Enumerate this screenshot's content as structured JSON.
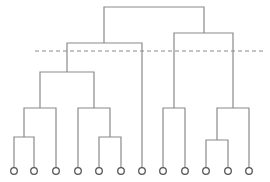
{
  "diagram": {
    "type": "dendrogram",
    "colors": {
      "line": "#8a8a8a",
      "cut": "#8a8a8a",
      "leaf": "#555555"
    },
    "leaf_count": 12,
    "leaves_x": [
      14,
      34,
      56,
      78,
      99,
      121,
      142,
      163,
      185,
      206,
      228,
      249
    ],
    "leaf_y": 171,
    "links": [
      {
        "x1": 14,
        "x2": 34,
        "y": 137,
        "from_y": [
          171,
          171
        ],
        "mid": 24
      },
      {
        "x1": 99,
        "x2": 121,
        "y": 137,
        "from_y": [
          171,
          171
        ],
        "mid": 110
      },
      {
        "x1": 206,
        "x2": 228,
        "y": 140,
        "from_y": [
          171,
          171
        ],
        "mid": 217
      },
      {
        "x1": 24,
        "x2": 56,
        "y": 108,
        "from_y": [
          137,
          171
        ],
        "mid": 40
      },
      {
        "x1": 78,
        "x2": 110,
        "y": 108,
        "from_y": [
          171,
          137
        ],
        "mid": 94
      },
      {
        "x1": 163,
        "x2": 185,
        "y": 108,
        "from_y": [
          171,
          171
        ],
        "mid": 174
      },
      {
        "x1": 217,
        "x2": 249,
        "y": 108,
        "from_y": [
          140,
          171
        ],
        "mid": 233
      },
      {
        "x1": 40,
        "x2": 94,
        "y": 72,
        "from_y": [
          108,
          108
        ],
        "mid": 67
      },
      {
        "x1": 67,
        "x2": 142,
        "y": 43,
        "from_y": [
          72,
          171
        ],
        "mid": 104
      },
      {
        "x1": 174,
        "x2": 233,
        "y": 33,
        "from_y": [
          108,
          108
        ],
        "mid": 204
      },
      {
        "x1": 104,
        "x2": 204,
        "y": 7,
        "from_y": [
          43,
          33
        ],
        "mid": 154
      }
    ],
    "cut_line": {
      "x1": 35,
      "x2": 265,
      "y": 51,
      "style": "dashed"
    }
  }
}
